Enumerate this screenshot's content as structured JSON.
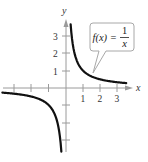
{
  "chart_data": {
    "type": "line",
    "title": "",
    "function_label": "f(x) = 1/x",
    "function_label_parts": {
      "lhs": "f(x) =",
      "numerator": "1",
      "denominator": "x"
    },
    "xlabel": "x",
    "ylabel": "y",
    "x_tick_labels": [
      "1",
      "2",
      "3"
    ],
    "y_tick_labels": [
      "1",
      "2",
      "3"
    ],
    "x_ticks": [
      -3,
      -2,
      -1,
      1,
      2,
      3
    ],
    "y_ticks": [
      -3,
      -2,
      -1,
      1,
      2,
      3
    ],
    "xlim": [
      -3.7,
      3.7
    ],
    "ylim": [
      -3.7,
      3.8
    ],
    "grid": false,
    "legend": "callout annotation pointing to right branch",
    "series": [
      {
        "name": "f(x) = 1/x (right branch)",
        "x": [
          0.27,
          0.33,
          0.5,
          0.75,
          1,
          1.5,
          2,
          2.5,
          3,
          3.5
        ],
        "y": [
          3.7,
          3.0,
          2.0,
          1.333,
          1.0,
          0.667,
          0.5,
          0.4,
          0.333,
          0.286
        ]
      },
      {
        "name": "f(x) = 1/x (left branch)",
        "x": [
          -3.7,
          -3,
          -2.5,
          -2,
          -1.5,
          -1,
          -0.75,
          -0.5,
          -0.33,
          -0.27
        ],
        "y": [
          -0.27,
          -0.333,
          -0.4,
          -0.5,
          -0.667,
          -1.0,
          -1.333,
          -2.0,
          -3.0,
          -3.7
        ]
      }
    ],
    "color": "#111111"
  }
}
